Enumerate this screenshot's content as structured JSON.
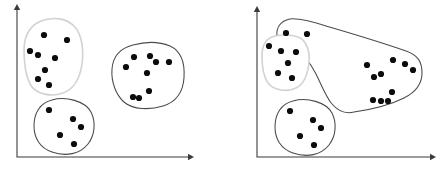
{
  "figure": {
    "title": "",
    "width": 443,
    "height": 171,
    "background_color": "#ffffff",
    "panel_count": 2,
    "point_color": "#0c0c0c",
    "point_radius": 3.1,
    "hull_dark_color": "#4a4a4a",
    "hull_light_color": "#d2d2d2",
    "axis_color": "#3b3b3b"
  },
  "panels": [
    {
      "name": "left-panel",
      "label": "",
      "axes": {
        "origin_x": 17,
        "origin_y": 157,
        "x_axis_end": 190,
        "y_axis_top": 8,
        "x_label": "",
        "y_label": ""
      },
      "clusters": [
        {
          "name": "cluster-upper-left",
          "label": "",
          "outline_style": "light",
          "hull_color": "#d2d2d2",
          "hull_path": "M 44 20 C 30 24 24 36 24 50 C 24 62 25 74 30 84 C 36 95 52 97 63 93 C 74 89 80 78 82 64 C 84 50 82 34 74 26 C 66 18 54 17 44 20 Z",
          "points": [
            {
              "x": 44,
              "y": 35
            },
            {
              "x": 67,
              "y": 40
            },
            {
              "x": 30,
              "y": 51
            },
            {
              "x": 38,
              "y": 55
            },
            {
              "x": 55,
              "y": 58
            },
            {
              "x": 45,
              "y": 70
            },
            {
              "x": 38,
              "y": 79
            },
            {
              "x": 49,
              "y": 85
            }
          ]
        },
        {
          "name": "cluster-right",
          "label": "",
          "outline_style": "dark",
          "hull_color": "#4a4a4a",
          "hull_path": "M 133 45 C 121 48 113 56 112 69 C 111 82 116 95 124 102 C 133 110 150 110 163 106 C 176 102 183 92 184 78 C 185 63 181 51 170 46 C 158 41 144 42 133 45 Z",
          "points": [
            {
              "x": 126,
              "y": 67
            },
            {
              "x": 134,
              "y": 57
            },
            {
              "x": 150,
              "y": 56
            },
            {
              "x": 156,
              "y": 62
            },
            {
              "x": 169,
              "y": 62
            },
            {
              "x": 147,
              "y": 73
            },
            {
              "x": 149,
              "y": 91
            },
            {
              "x": 133,
              "y": 97
            },
            {
              "x": 139,
              "y": 98
            }
          ]
        },
        {
          "name": "cluster-lower-left",
          "label": "",
          "outline_style": "dark",
          "hull_color": "#4a4a4a",
          "hull_path": "M 52 100 C 40 103 34 113 34 126 C 34 138 40 148 52 152 C 66 157 80 154 88 144 C 95 135 96 122 91 112 C 85 101 66 96 52 100 Z",
          "points": [
            {
              "x": 49,
              "y": 110
            },
            {
              "x": 73,
              "y": 119
            },
            {
              "x": 81,
              "y": 127
            },
            {
              "x": 60,
              "y": 135
            },
            {
              "x": 74,
              "y": 144
            }
          ]
        }
      ]
    },
    {
      "name": "right-panel",
      "label": "",
      "axes": {
        "origin_x": 257,
        "origin_y": 157,
        "x_axis_end": 432,
        "y_axis_top": 10,
        "x_label": "",
        "y_label": ""
      },
      "clusters": [
        {
          "name": "cluster-merged-large",
          "label": "",
          "outline_style": "dark",
          "hull_path": "M 290 19 C 280 21 276 28 277 36 C 278 43 286 47 294 50 C 304 54 310 62 316 74 C 322 86 326 97 332 104 C 338 111 346 114 354 112 C 368 110 388 106 404 98 C 416 92 422 84 422 73 C 422 62 418 55 406 51 C 386 44 350 33 326 26 C 310 21 298 18 290 19 Z",
          "points": [
            {
              "x": 286,
              "y": 33
            },
            {
              "x": 307,
              "y": 34
            },
            {
              "x": 367,
              "y": 65
            },
            {
              "x": 393,
              "y": 60
            },
            {
              "x": 405,
              "y": 64
            },
            {
              "x": 413,
              "y": 70
            },
            {
              "x": 381,
              "y": 74
            },
            {
              "x": 374,
              "y": 77
            },
            {
              "x": 392,
              "y": 92
            },
            {
              "x": 373,
              "y": 100
            },
            {
              "x": 381,
              "y": 101
            },
            {
              "x": 388,
              "y": 101
            }
          ]
        },
        {
          "name": "cluster-upper-left-small",
          "label": "",
          "outline_style": "light",
          "hull_color": "#d2d2d2",
          "hull_path": "M 275 36 C 266 38 262 46 262 56 C 262 66 263 76 268 83 C 274 91 288 92 296 88 C 304 84 308 74 309 62 C 310 50 306 40 298 37 C 290 34 281 35 275 36 Z",
          "points": [
            {
              "x": 269,
              "y": 46
            },
            {
              "x": 281,
              "y": 51
            },
            {
              "x": 296,
              "y": 52
            },
            {
              "x": 288,
              "y": 63
            },
            {
              "x": 278,
              "y": 73
            },
            {
              "x": 292,
              "y": 78
            }
          ]
        },
        {
          "name": "cluster-lower-left-small",
          "label": "",
          "outline_style": "dark",
          "hull_color": "#4a4a4a",
          "hull_path": "M 293 101 C 281 104 275 114 275 127 C 275 139 281 149 293 153 C 307 158 321 155 329 145 C 336 136 337 123 332 113 C 326 102 307 97 293 101 Z",
          "points": [
            {
              "x": 290,
              "y": 111
            },
            {
              "x": 313,
              "y": 120
            },
            {
              "x": 321,
              "y": 128
            },
            {
              "x": 300,
              "y": 136
            },
            {
              "x": 314,
              "y": 145
            }
          ]
        }
      ]
    }
  ]
}
